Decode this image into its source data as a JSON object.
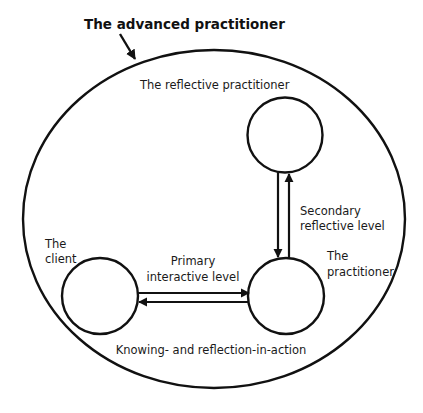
{
  "diagram": {
    "title": "The advanced practitioner",
    "outer_label": "The reflective practitioner",
    "nodes": {
      "reflective": {
        "label": ""
      },
      "practitioner": {
        "label_line1": "The",
        "label_line2": "practitioner"
      },
      "client": {
        "label_line1": "The",
        "label_line2": "client"
      }
    },
    "edges": {
      "secondary": {
        "label_line1": "Secondary",
        "label_line2": "reflective level"
      },
      "primary": {
        "label_line1": "Primary",
        "label_line2": "interactive level"
      }
    },
    "bottom_label": "Knowing- and reflection-in-action"
  }
}
